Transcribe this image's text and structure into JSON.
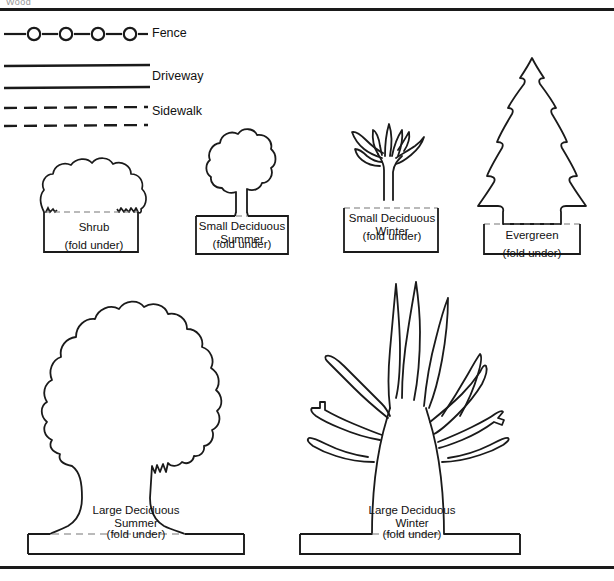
{
  "page": {
    "clipped_header_text": "Wood",
    "background": "#ffffff",
    "ink": "#1a1a1a",
    "rules": {
      "top": true,
      "bottom": true
    }
  },
  "legend": {
    "title": "",
    "items": [
      {
        "label": "Fence",
        "symbol": "fence-line-with-posts",
        "icon_name": "fence-symbol"
      },
      {
        "label": "Driveway",
        "symbol": "double-solid-line",
        "icon_name": "driveway-symbol"
      },
      {
        "label": "Sidewalk",
        "symbol": "double-dashed-line",
        "icon_name": "sidewalk-symbol"
      }
    ]
  },
  "tiles": {
    "row1": [
      {
        "id": "shrub",
        "shape": "shrub",
        "title_lines": [
          "Shrub"
        ],
        "fold": "(fold under)"
      },
      {
        "id": "small-deciduous-summer",
        "shape": "small-deciduous-summer",
        "title_lines": [
          "Small Deciduous",
          "Summer"
        ],
        "fold": "(fold under)"
      },
      {
        "id": "small-deciduous-winter",
        "shape": "small-deciduous-winter",
        "title_lines": [
          "Small Deciduous",
          "Winter"
        ],
        "fold": "(fold under)"
      },
      {
        "id": "evergreen",
        "shape": "evergreen",
        "title_lines": [
          "Evergreen"
        ],
        "fold": "(fold under)"
      }
    ],
    "row2": [
      {
        "id": "large-deciduous-summer",
        "shape": "large-deciduous-summer",
        "title_lines": [
          "Large Deciduous",
          "Summer"
        ],
        "fold": "(fold under)"
      },
      {
        "id": "large-deciduous-winter",
        "shape": "large-deciduous-winter",
        "title_lines": [
          "Large Deciduous",
          "Winter"
        ],
        "fold": "(fold under)"
      }
    ]
  }
}
